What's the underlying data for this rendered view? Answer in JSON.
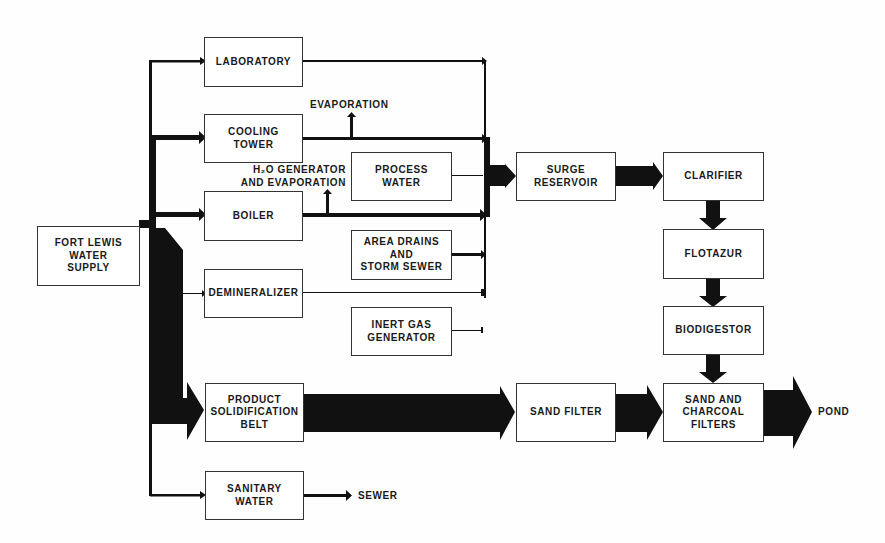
{
  "diagram": {
    "title": "",
    "nodes": {
      "fort_lewis": "FORT LEWIS\nWATER\nSUPPLY",
      "laboratory": "LABORATORY",
      "cooling_tower": "COOLING\nTOWER",
      "boiler": "BOILER",
      "demineralizer": "DEMINERALIZER",
      "product_belt": "PRODUCT\nSOLIDIFICATION\nBELT",
      "sanitary_water": "SANITARY\nWATER",
      "process_water": "PROCESS\nWATER",
      "area_drains": "AREA DRAINS\nAND\nSTORM SEWER",
      "inert_gas": "INERT GAS\nGENERATOR",
      "surge_reservoir": "SURGE\nRESERVOIR",
      "clarifier": "CLARIFIER",
      "flotazur": "FLOTAZUR",
      "biodigestor": "BIODIGESTOR",
      "sand_filter": "SAND FILTER",
      "sand_charcoal": "SAND AND\nCHARCOAL\nFILTERS"
    },
    "labels": {
      "evaporation": "EVAPORATION",
      "h2o_generator": "H₂O GENERATOR\nAND EVAPORATION",
      "sewer": "SEWER",
      "pond": "POND"
    },
    "edges": [
      {
        "from": "FORT LEWIS WATER SUPPLY",
        "to": "LABORATORY"
      },
      {
        "from": "FORT LEWIS WATER SUPPLY",
        "to": "COOLING TOWER"
      },
      {
        "from": "FORT LEWIS WATER SUPPLY",
        "to": "BOILER"
      },
      {
        "from": "FORT LEWIS WATER SUPPLY",
        "to": "DEMINERALIZER"
      },
      {
        "from": "FORT LEWIS WATER SUPPLY",
        "to": "PRODUCT SOLIDIFICATION BELT"
      },
      {
        "from": "FORT LEWIS WATER SUPPLY",
        "to": "SANITARY WATER"
      },
      {
        "from": "COOLING TOWER",
        "to": "EVAPORATION"
      },
      {
        "from": "BOILER",
        "to": "H2O GENERATOR AND EVAPORATION"
      },
      {
        "from": "LABORATORY",
        "to": "SURGE RESERVOIR"
      },
      {
        "from": "COOLING TOWER",
        "to": "SURGE RESERVOIR"
      },
      {
        "from": "PROCESS WATER",
        "to": "SURGE RESERVOIR"
      },
      {
        "from": "BOILER",
        "to": "SURGE RESERVOIR"
      },
      {
        "from": "AREA DRAINS AND STORM SEWER",
        "to": "SURGE RESERVOIR"
      },
      {
        "from": "DEMINERALIZER",
        "to": "SURGE RESERVOIR"
      },
      {
        "from": "INERT GAS GENERATOR",
        "to": "SURGE RESERVOIR"
      },
      {
        "from": "SURGE RESERVOIR",
        "to": "CLARIFIER"
      },
      {
        "from": "CLARIFIER",
        "to": "FLOTAZUR"
      },
      {
        "from": "FLOTAZUR",
        "to": "BIODIGESTOR"
      },
      {
        "from": "BIODIGESTOR",
        "to": "SAND AND CHARCOAL FILTERS"
      },
      {
        "from": "PRODUCT SOLIDIFICATION BELT",
        "to": "SAND FILTER"
      },
      {
        "from": "SAND FILTER",
        "to": "SAND AND CHARCOAL FILTERS"
      },
      {
        "from": "SAND AND CHARCOAL FILTERS",
        "to": "POND"
      },
      {
        "from": "SANITARY WATER",
        "to": "SEWER"
      }
    ]
  }
}
